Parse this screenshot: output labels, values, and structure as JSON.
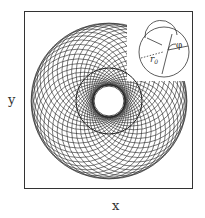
{
  "figure": {
    "x_label": "x",
    "y_label": "y",
    "inset": {
      "radius_label": "r",
      "radius_subscript": "0",
      "angle_label": "φ"
    },
    "colors": {
      "line": "#222222",
      "frame": "#333333",
      "background": "#ffffff"
    }
  }
}
